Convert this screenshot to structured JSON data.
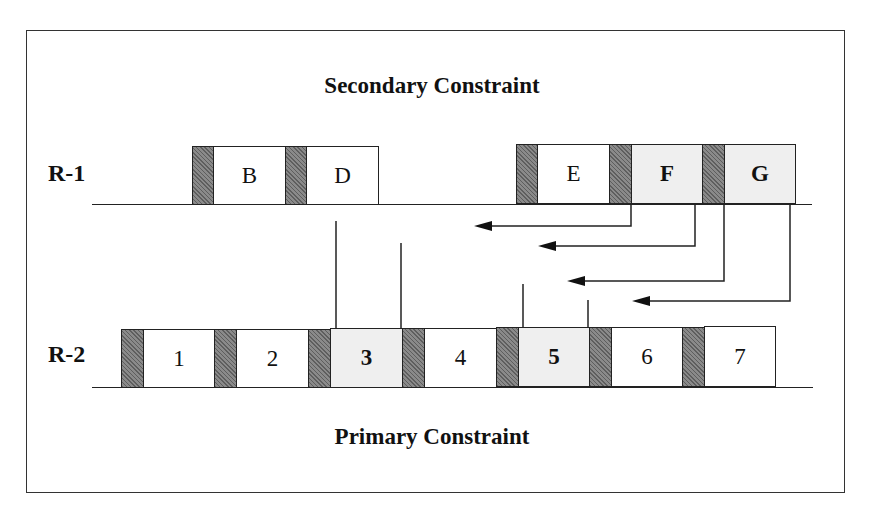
{
  "diagram": {
    "top_title": "Secondary Constraint",
    "bottom_title": "Primary Constraint",
    "rows": [
      {
        "label": "R-1",
        "blocks": [
          {
            "label": "B",
            "highlighted": false
          },
          {
            "label": "D",
            "highlighted": false
          },
          {
            "label": "E",
            "highlighted": false
          },
          {
            "label": "F",
            "highlighted": true
          },
          {
            "label": "G",
            "highlighted": true
          }
        ]
      },
      {
        "label": "R-2",
        "blocks": [
          {
            "label": "1",
            "highlighted": false
          },
          {
            "label": "2",
            "highlighted": false
          },
          {
            "label": "3",
            "highlighted": true
          },
          {
            "label": "4",
            "highlighted": false
          },
          {
            "label": "5",
            "highlighted": true
          },
          {
            "label": "6",
            "highlighted": false
          },
          {
            "label": "7",
            "highlighted": false
          }
        ]
      }
    ],
    "colors": {
      "separator_hatch": "#7a7a7a",
      "highlight_fill": "#efefef",
      "line": "#222222"
    }
  }
}
